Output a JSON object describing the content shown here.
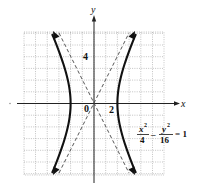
{
  "chart_data": {
    "type": "line",
    "title": "",
    "equation": {
      "x_term": "x",
      "x_exp": "2",
      "x_den": "4",
      "minus": "–",
      "y_term": "y",
      "y_exp": "2",
      "y_den": "16",
      "rhs": "= 1"
    },
    "xlabel": "x",
    "ylabel": "y",
    "xlim": [
      -6,
      6
    ],
    "ylim": [
      -6,
      6
    ],
    "grid": true,
    "tick_labels": {
      "origin": "0",
      "x": "2",
      "y": "4"
    },
    "series": [
      {
        "name": "hyperbola-right-branch",
        "style": "solid-bold-arrows",
        "x": [
          5.6,
          4.5,
          3.6,
          2.83,
          2.24,
          2.0,
          2.24,
          2.83,
          3.6,
          4.5,
          5.6
        ],
        "y": [
          -10.7,
          -8.06,
          -6.0,
          -4.0,
          -2.0,
          0,
          2.0,
          4.0,
          6.0,
          8.06,
          10.7
        ]
      },
      {
        "name": "hyperbola-left-branch",
        "style": "solid-bold-arrows",
        "x": [
          -5.6,
          -4.5,
          -3.6,
          -2.83,
          -2.24,
          -2.0,
          -2.24,
          -2.83,
          -3.6,
          -4.5,
          -5.6
        ],
        "y": [
          -10.7,
          -8.06,
          -6.0,
          -4.0,
          -2.0,
          0,
          2.0,
          4.0,
          6.0,
          8.06,
          10.7
        ]
      },
      {
        "name": "asymptote y=2x",
        "style": "dashed",
        "x": [
          -3,
          3
        ],
        "y": [
          -6,
          6
        ]
      },
      {
        "name": "asymptote y=-2x",
        "style": "dashed",
        "x": [
          -3,
          3
        ],
        "y": [
          6,
          -6
        ]
      }
    ],
    "colors": {
      "curve": "#111111",
      "asymptote": "#444444",
      "grid": "#9a9a9a",
      "axis": "#222222"
    }
  }
}
